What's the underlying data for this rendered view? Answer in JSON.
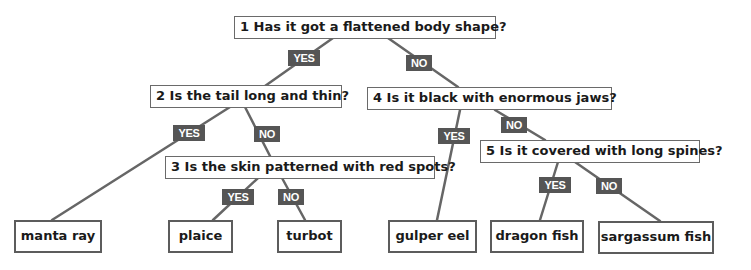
{
  "colors": {
    "line": "#666666",
    "tag_bg": "#555555",
    "tag_text": "#ffffff",
    "box_border": "#6a6a6a",
    "text": "#1a1a1a"
  },
  "questions": [
    {
      "id": 1,
      "text": "1 Has it got a flattened body shape?"
    },
    {
      "id": 2,
      "text": "2 Is the tail long and thin?"
    },
    {
      "id": 3,
      "text": "3 Is the skin patterned with red spots?"
    },
    {
      "id": 4,
      "text": "4 Is it black with enormous jaws?"
    },
    {
      "id": 5,
      "text": "5 Is it covered with long spines?"
    }
  ],
  "answers": {
    "yes": "YES",
    "no": "NO"
  },
  "leaves": [
    "manta ray",
    "plaice",
    "turbot",
    "gulper eel",
    "dragon fish",
    "sargassum fish"
  ]
}
